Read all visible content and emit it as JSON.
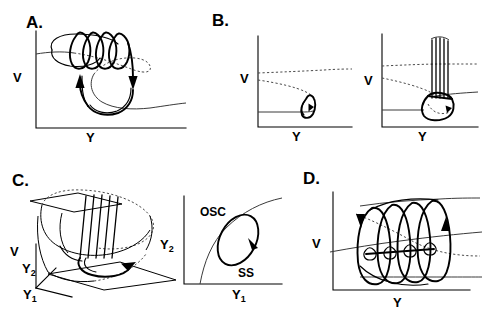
{
  "figure": {
    "background": "#ffffff",
    "ink": "#000000"
  },
  "panels": [
    {
      "id": "A",
      "letter": "A.",
      "xlabel": "Y",
      "ylabel": "V",
      "description": "Spiral bursting trajectory with cubic nullcline and two descending arrows",
      "spiral_loops": 4,
      "arrows": 2
    },
    {
      "id": "B",
      "letter": "B.",
      "subplots": [
        {
          "id": "B-left",
          "xlabel": "Y",
          "ylabel": "V",
          "description": "Small limit cycle loop at fold with dotted nullclines",
          "spike_lines": 0
        },
        {
          "id": "B-right",
          "xlabel": "Y",
          "ylabel": "V",
          "description": "Small loop with vertical spike train rising from the fold",
          "spike_lines": 5
        }
      ]
    },
    {
      "id": "C",
      "letter": "C.",
      "subplots": [
        {
          "id": "C-left",
          "xlabel": "Y1",
          "ylabel": "V",
          "zlabel": "Y2",
          "axis_labels": [
            "V",
            "Y",
            "Y"
          ],
          "axis_label_v": "V",
          "axis_label_y2": "Y",
          "axis_label_y2_sub": "2",
          "axis_label_y1": "Y",
          "axis_label_y1_sub": "1",
          "description": "3D folded slow manifold with vertical spike train and circulating trajectory",
          "spike_lines": 5
        },
        {
          "id": "C-right",
          "xlabel": "Y",
          "xlabel_sub": "1",
          "ylabel": "Y",
          "ylabel_sub": "2",
          "region_upper": "OSC",
          "region_lower": "SS",
          "description": "Slow-variable plane: tilted limit cycle crossing the bifurcation curve separating OSC and SS regions"
        }
      ]
    },
    {
      "id": "D",
      "letter": "D.",
      "xlabel": "Y",
      "ylabel": "V",
      "description": "Tall nested oscillation loops between upper and lower branches with descending and ascending arrows",
      "loops": 4,
      "arrows": 2
    }
  ],
  "labels": {
    "A": "A.",
    "B": "B.",
    "C": "C.",
    "D": "D.",
    "V": "V",
    "Y": "Y",
    "Y1_base": "Y",
    "Y1_sub": "1",
    "Y2_base": "Y",
    "Y2_sub": "2",
    "OSC": "OSC",
    "SS": "SS"
  }
}
